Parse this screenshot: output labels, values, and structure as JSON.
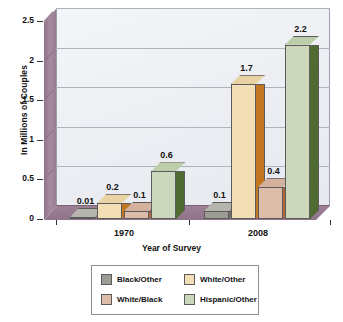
{
  "chart_data": {
    "type": "bar",
    "title": "",
    "xlabel": "Year of Survey",
    "ylabel": "In Millions of Couples",
    "categories": [
      "1970",
      "2008"
    ],
    "series": [
      {
        "name": "Black/Other",
        "values": [
          0.01,
          0.1
        ],
        "labels": [
          "0.01",
          "0.1"
        ],
        "color": "#9c9c94",
        "side_color": "#6f6f68",
        "top_color": "#b5b5ad"
      },
      {
        "name": "White/Other",
        "values": [
          0.2,
          1.7
        ],
        "labels": [
          "0.2",
          "1.7"
        ],
        "color": "#f2dfb6",
        "side_color": "#c1761f",
        "top_color": "#e9d3a4"
      },
      {
        "name": "White/Black",
        "values": [
          0.1,
          0.4
        ],
        "labels": [
          "0.1",
          "0.4"
        ],
        "color": "#ddbda9",
        "side_color": "#b5673a",
        "top_color": "#d4b19c"
      },
      {
        "name": "Hispanic/Other",
        "values": [
          0.6,
          2.2
        ],
        "labels": [
          "0.6",
          "2.2"
        ],
        "color": "#cbd8bb",
        "side_color": "#4f6b32",
        "top_color": "#bccdaa"
      }
    ],
    "ylim": [
      0,
      2.5
    ],
    "yticks": [
      0,
      0.5,
      1,
      1.5,
      2,
      2.5
    ],
    "ytick_labels": [
      "0",
      "0.5",
      "1",
      "1.5",
      "2",
      "2.5"
    ],
    "grid": true,
    "legend_position": "bottom",
    "three_d": true,
    "plot_colors": {
      "back_wall": "#eceef3",
      "floor": "#9d8296",
      "left_wall": "#a78ba2",
      "gridline": "#aeb4bd",
      "axis_text": "#111111"
    }
  },
  "legend": {
    "items": [
      {
        "label": "Black/Other",
        "color": "#9c9c94"
      },
      {
        "label": "White/Other",
        "color": "#f2dfb6"
      },
      {
        "label": "White/Black",
        "color": "#ddbda9"
      },
      {
        "label": "Hispanic/Other",
        "color": "#cbd8bb"
      }
    ]
  }
}
